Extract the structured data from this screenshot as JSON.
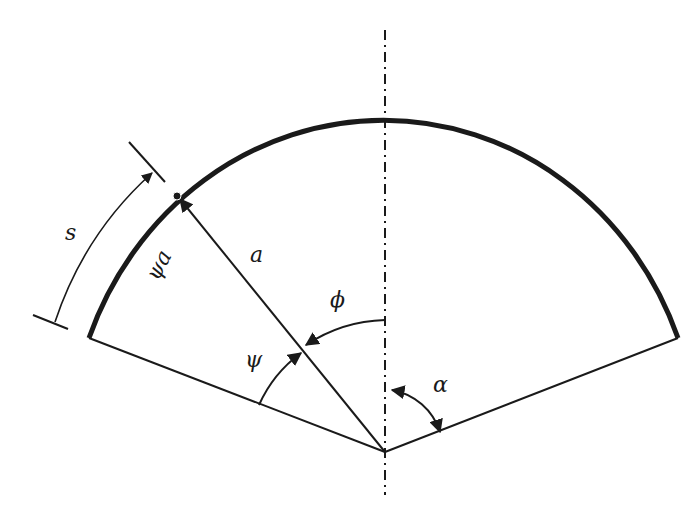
{
  "diagram": {
    "labels": {
      "s": "s",
      "psi_a": "ψa",
      "a": "a",
      "phi": "ϕ",
      "psi": "ψ",
      "alpha": "α"
    },
    "colors": {
      "stroke": "#1a1a1a",
      "background": "#ffffff"
    },
    "geometry": {
      "center": [
        385,
        452
      ],
      "arc_left_end": [
        89,
        338
      ],
      "arc_top": [
        385,
        116
      ],
      "arc_right_end": [
        678,
        338
      ],
      "point_on_arc": [
        177,
        196
      ],
      "axis_top_y": 30,
      "axis_bottom_y": 495
    }
  }
}
